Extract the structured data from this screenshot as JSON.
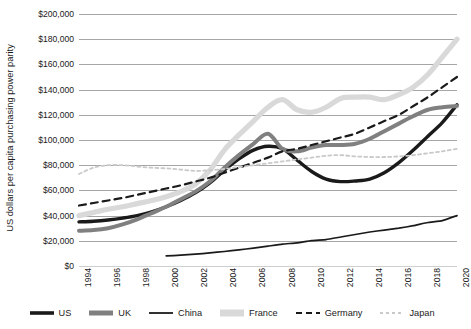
{
  "chart_data": {
    "type": "line",
    "title": "",
    "xlabel": "",
    "ylabel": "US dollars per capita purchasing power parity",
    "xlim": [
      1994,
      2020
    ],
    "ylim": [
      0,
      200000
    ],
    "grid": true,
    "legend_position": "bottom",
    "y_ticks": [
      "$0",
      "$20,000",
      "$40,000",
      "$60,000",
      "$80,000",
      "$100,000",
      "$120,000",
      "$140,000",
      "$160,000",
      "$180,000",
      "$200,000"
    ],
    "y_tick_values": [
      0,
      20000,
      40000,
      60000,
      80000,
      100000,
      120000,
      140000,
      160000,
      180000,
      200000
    ],
    "x_ticks": [
      "1994",
      "1996",
      "1998",
      "2000",
      "2002",
      "2004",
      "2006",
      "2008",
      "2010",
      "2012",
      "2014",
      "2016",
      "2018",
      "2020"
    ],
    "x": [
      1994,
      1995,
      1996,
      1997,
      1998,
      1999,
      2000,
      2001,
      2002,
      2003,
      2004,
      2005,
      2006,
      2007,
      2008,
      2009,
      2010,
      2011,
      2012,
      2013,
      2014,
      2015,
      2016,
      2017,
      2018,
      2019,
      2020
    ],
    "series": [
      {
        "name": "US",
        "color": "#1a1a1a",
        "width": 3.4,
        "dash": "none",
        "values": [
          35000,
          35500,
          36500,
          38000,
          40000,
          43000,
          47000,
          52000,
          58000,
          66000,
          76000,
          85000,
          92000,
          95000,
          93000,
          84000,
          75000,
          69000,
          67000,
          67500,
          69000,
          74000,
          82000,
          92000,
          103000,
          114000,
          128000
        ]
      },
      {
        "name": "UK",
        "color": "#808080",
        "width": 4.0,
        "dash": "none",
        "values": [
          28000,
          28500,
          30000,
          33000,
          37000,
          42000,
          47000,
          53000,
          59000,
          67000,
          78000,
          88000,
          97000,
          105000,
          93000,
          91000,
          94000,
          96000,
          96000,
          97000,
          101000,
          107000,
          113000,
          119000,
          124000,
          126000,
          127000
        ]
      },
      {
        "name": "China",
        "color": "#1a1a1a",
        "width": 1.7,
        "dash": "none",
        "values": [
          null,
          null,
          null,
          null,
          null,
          null,
          8000,
          8600,
          9400,
          10400,
          11500,
          12800,
          14200,
          15800,
          17400,
          18400,
          20200,
          21000,
          23000,
          25000,
          27000,
          28500,
          30000,
          32000,
          34500,
          36000,
          40000
        ]
      },
      {
        "name": "France",
        "color": "#d9d9d9",
        "width": 5.2,
        "dash": "none",
        "values": [
          40000,
          42500,
          45000,
          47000,
          49500,
          52000,
          55000,
          59000,
          65000,
          76000,
          92000,
          104000,
          115000,
          126000,
          132000,
          124000,
          122000,
          126000,
          133000,
          134000,
          134000,
          132000,
          136000,
          142000,
          152000,
          166000,
          180000
        ]
      },
      {
        "name": "Germany",
        "color": "#1a1a1a",
        "width": 2.2,
        "dash": "dashed",
        "values": [
          48000,
          50000,
          52000,
          54000,
          56500,
          59000,
          61500,
          64000,
          67000,
          70000,
          74000,
          78000,
          82000,
          86000,
          91000,
          93000,
          96000,
          99000,
          102000,
          105000,
          110000,
          115000,
          120000,
          127000,
          134000,
          142000,
          150000
        ]
      },
      {
        "name": "Japan",
        "color": "#c9c9c9",
        "width": 1.8,
        "dash": "dotted",
        "values": [
          73000,
          78000,
          80000,
          80000,
          79000,
          78000,
          77500,
          76500,
          75500,
          76000,
          77000,
          78500,
          80000,
          81500,
          83000,
          84500,
          86000,
          87500,
          88000,
          87000,
          86500,
          86500,
          87000,
          88000,
          89500,
          91000,
          93000
        ]
      }
    ],
    "legend": [
      {
        "label": "US",
        "color": "#1a1a1a",
        "style": "thick-solid",
        "swatch": "legend-swatch-us"
      },
      {
        "label": "UK",
        "color": "#808080",
        "style": "thick-solid",
        "swatch": "legend-swatch-uk"
      },
      {
        "label": "China",
        "color": "#1a1a1a",
        "style": "thin-solid",
        "swatch": "legend-swatch-china"
      },
      {
        "label": "France",
        "color": "#d9d9d9",
        "style": "thick-solid",
        "swatch": "legend-swatch-france"
      },
      {
        "label": "Germany",
        "color": "#1a1a1a",
        "style": "dashed",
        "swatch": "legend-swatch-germany"
      },
      {
        "label": "Japan",
        "color": "#c9c9c9",
        "style": "dotted",
        "swatch": "legend-swatch-japan"
      }
    ]
  }
}
